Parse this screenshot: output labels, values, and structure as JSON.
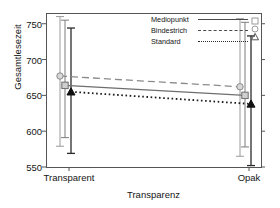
{
  "chart_data": {
    "type": "line",
    "title": "",
    "xlabel": "Transparenz",
    "ylabel": "Gesamtlesezeit",
    "categories": [
      "Transparent",
      "Opak"
    ],
    "ylim": [
      550,
      765
    ],
    "yticks": [
      550,
      600,
      650,
      700,
      750
    ],
    "grid": false,
    "legend_position": "top-right",
    "error_bars": "confidence interval",
    "series": [
      {
        "name": "Mediopunkt",
        "line_style": "solid",
        "marker": "square",
        "color": "#6e6e6e",
        "values": [
          664,
          650
        ],
        "err_low": [
          591,
          578
        ],
        "err_high": [
          755,
          752
        ]
      },
      {
        "name": "Bindestrich",
        "line_style": "dashed",
        "marker": "circle",
        "color": "#8a8a8a",
        "values": [
          677,
          662
        ],
        "err_low": [
          579,
          565
        ],
        "err_high": [
          760,
          757
        ]
      },
      {
        "name": "Standard",
        "line_style": "dotted",
        "marker": "triangle",
        "color": "#1a1a1a",
        "values": [
          655,
          638
        ],
        "err_low": [
          569,
          552
        ],
        "err_high": [
          744,
          733
        ]
      }
    ]
  },
  "legend": {
    "items": [
      {
        "label": "Mediopunkt",
        "style": "solid"
      },
      {
        "label": "Bindestrich",
        "style": "dashed"
      },
      {
        "label": "Standard",
        "style": "dotted"
      }
    ]
  }
}
